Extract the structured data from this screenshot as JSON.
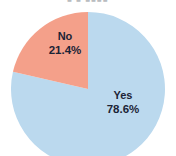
{
  "chart_data": {
    "type": "pie",
    "title": "",
    "categories": [
      "Yes",
      "No"
    ],
    "values": [
      78.6,
      21.4
    ],
    "unit": "%",
    "slices": [
      {
        "label": "Yes",
        "value": 78.6,
        "value_text": "78.6%",
        "color": "#bbd9ee",
        "start_angle_deg": 0,
        "sweep_deg": 282.96
      },
      {
        "label": "No",
        "value": 21.4,
        "value_text": "21.4%",
        "color": "#f4a08a",
        "start_angle_deg": 282.96,
        "sweep_deg": 77.04
      }
    ],
    "legend": "none",
    "grid": false,
    "xlabel": "",
    "ylabel": "",
    "label_color": "#1b2436",
    "background": "#ffffff"
  },
  "header": {
    "title_fragment": "■ ■ ■■■■"
  },
  "labels": {
    "yes_name": "Yes",
    "yes_pct": "78.6%",
    "no_name": "No",
    "no_pct": "21.4%"
  }
}
